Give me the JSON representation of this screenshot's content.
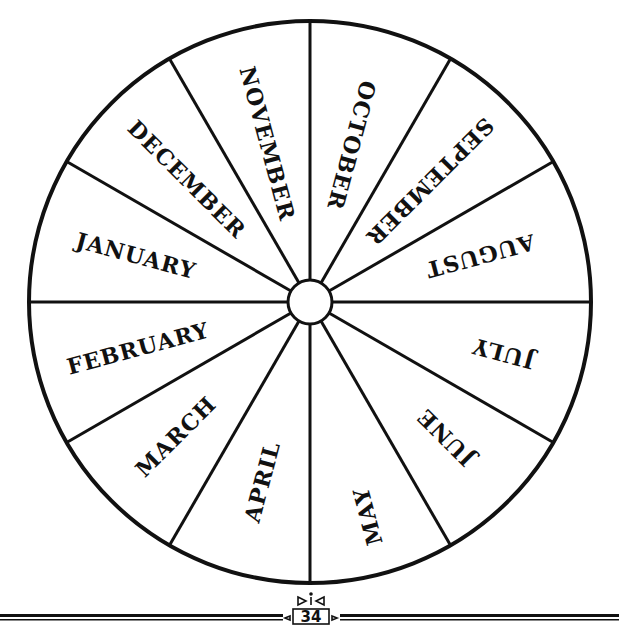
{
  "diagram": {
    "type": "month-wheel",
    "center": [
      310,
      302
    ],
    "radius": 281,
    "hub_radius": 22,
    "sectors": 12,
    "line_color": "#111111",
    "months": [
      {
        "label": "JANUARY",
        "angle": 165,
        "r": 180,
        "size": 22
      },
      {
        "label": "FEBRUARY",
        "angle": 195,
        "r": 178,
        "size": 22
      },
      {
        "label": "MARCH",
        "angle": 225,
        "r": 190,
        "size": 22
      },
      {
        "label": "APRIL",
        "angle": 255,
        "r": 186,
        "size": 22
      },
      {
        "label": "MAY",
        "angle": 285,
        "r": 222,
        "size": 22
      },
      {
        "label": "JUNE",
        "angle": 315,
        "r": 192,
        "size": 22
      },
      {
        "label": "JULY",
        "angle": 345,
        "r": 200,
        "size": 22
      },
      {
        "label": "AUGUST",
        "angle": 15,
        "r": 176,
        "size": 22
      },
      {
        "label": "SEPTEMBER",
        "angle": 45,
        "r": 170,
        "size": 22
      },
      {
        "label": "OCTOBER",
        "angle": 75,
        "r": 162,
        "size": 22
      },
      {
        "label": "NOVEMBER",
        "angle": 105,
        "r": 164,
        "size": 22
      },
      {
        "label": "DECEMBER",
        "angle": 135,
        "r": 174,
        "size": 22
      }
    ]
  },
  "footer": {
    "page_number": "34"
  }
}
